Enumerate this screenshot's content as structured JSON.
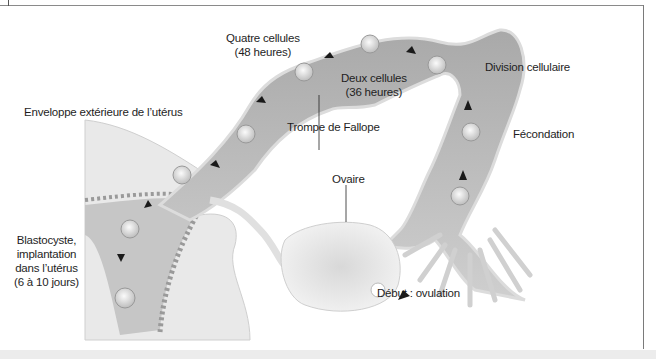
{
  "figure": {
    "title_partial": "",
    "labels": {
      "quatre_cellules": [
        "Quatre cellules",
        "(48 heures)"
      ],
      "deux_cellules": [
        "Deux cellules",
        "(36 heures)"
      ],
      "division": "Division cellulaire",
      "enveloppe": "Enveloppe extérieure de l’utérus",
      "trompe": "Trompe de Fallope",
      "fecondation": "Fécondation",
      "ovaire": "Ovaire",
      "blastocyste": [
        "Blastocyste,",
        "implantation",
        "dans l’utérus",
        "(6 à 10 jours)"
      ],
      "debut": "Début : ovulation"
    },
    "colors": {
      "tube_fill": "#bdbdbd",
      "tube_light": "#e6e6e6",
      "uterus_wall": "#d4d4d4",
      "arrow": "#1a1a1a",
      "text": "#1e1e1e",
      "frame": "#8a8a8a"
    }
  }
}
